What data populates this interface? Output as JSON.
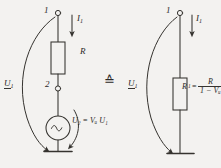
{
  "figure": {
    "type": "circuit-diagram",
    "ink_color": "#35332f",
    "background_color": "#f3f2f0",
    "equivalence_symbol": "≙"
  },
  "left_circuit": {
    "node1_label": "1",
    "node2_label": "2",
    "current_label": "I",
    "current_sub": "1",
    "resistor_label": "R",
    "input_voltage_label": "U",
    "input_voltage_sub": "1",
    "source_label": "U₂ = Vᵤ U₁",
    "source_symbol": "~"
  },
  "right_circuit": {
    "node1_label": "1",
    "current_label": "I",
    "current_sub": "1",
    "input_voltage_label": "U",
    "input_voltage_sub": "1",
    "formula_lhs": "R",
    "formula_lhs_sub": "1",
    "formula_eq": "=",
    "formula_numerator": "R",
    "formula_denominator": "1 − Vᵤ"
  }
}
